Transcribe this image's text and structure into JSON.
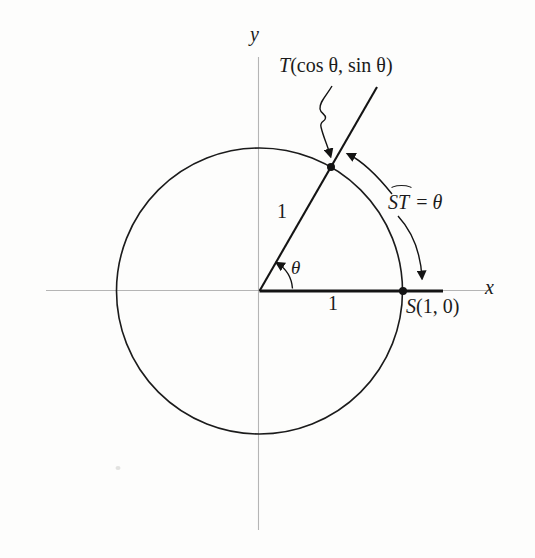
{
  "figure": {
    "background": "#fdfdfc",
    "ink_color": "#1b1b1b",
    "axis_color": "#b5b5b5",
    "axes": {
      "x_label": "x",
      "y_label": "y"
    },
    "point_T": {
      "name": "T",
      "coords": "(cos θ, sin θ)"
    },
    "point_S": {
      "name": "S",
      "coords": "(1, 0)"
    },
    "arc_equation": {
      "arc_name": "ST",
      "equals": "=",
      "value": "θ"
    },
    "angle_symbol": "θ",
    "radius_label": "1",
    "base_label": "1"
  }
}
